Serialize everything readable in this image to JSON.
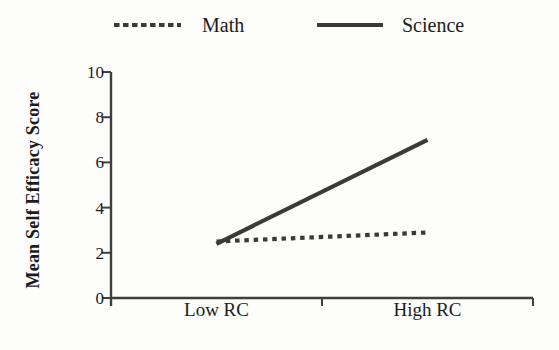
{
  "colors": {
    "background": "#fdfdfc",
    "axis": "#3f3f3f",
    "text": "#1c1c1c",
    "line": "#3a3a3a"
  },
  "chart_data": {
    "type": "line",
    "categories": [
      "Low RC",
      "High RC"
    ],
    "series": [
      {
        "name": "Math",
        "values": [
          2.5,
          2.9
        ],
        "line_style": "dashed",
        "color": "#3a3a3a"
      },
      {
        "name": "Science",
        "values": [
          2.4,
          7.0
        ],
        "line_style": "solid",
        "color": "#3a3a3a"
      }
    ],
    "title": "",
    "xlabel": "",
    "ylabel": "Mean Self Efficacy Score",
    "ylim": [
      0,
      10
    ],
    "yticks": [
      0,
      2,
      4,
      6,
      8,
      10
    ],
    "grid": false,
    "legend_position": "top"
  }
}
